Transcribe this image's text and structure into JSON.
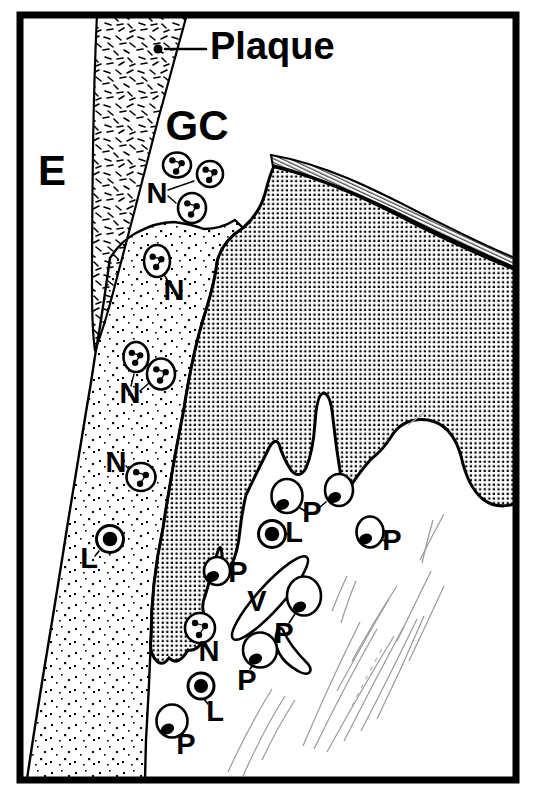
{
  "colors": {
    "ink": "#000000",
    "paper": "#ffffff",
    "fiber": "#999999"
  },
  "labels": {
    "enamel": "E",
    "crevice": "GC",
    "plaque": "Plaque"
  },
  "diagram": {
    "plaque_pointer_dot": {
      "x": 158,
      "y": 49,
      "r": 4.5
    },
    "leader_lines": [
      {
        "x1": 206,
        "y1": 49,
        "x2": 165,
        "y2": 49,
        "w": 2.5
      },
      {
        "x1": 168,
        "y1": 190,
        "x2": 194,
        "y2": 181,
        "w": 1.4
      },
      {
        "x1": 168,
        "y1": 196,
        "x2": 176,
        "y2": 203,
        "w": 1.4
      },
      {
        "x1": 165,
        "y1": 276,
        "x2": 171,
        "y2": 287,
        "w": 1.6
      },
      {
        "x1": 131,
        "y1": 386,
        "x2": 134,
        "y2": 374,
        "w": 1.4
      },
      {
        "x1": 140,
        "y1": 391,
        "x2": 149,
        "y2": 383,
        "w": 1.4
      },
      {
        "x1": 126,
        "y1": 466,
        "x2": 130,
        "y2": 470,
        "w": 1.6
      },
      {
        "x1": 203,
        "y1": 644,
        "x2": 207,
        "y2": 649,
        "w": 1.6
      },
      {
        "x1": 95,
        "y1": 556,
        "x2": 99,
        "y2": 551,
        "w": 1.6
      },
      {
        "x1": 287,
        "y1": 534,
        "x2": 290,
        "y2": 535,
        "w": 1.6
      },
      {
        "x1": 208,
        "y1": 704,
        "x2": 204,
        "y2": 699,
        "w": 1.6
      },
      {
        "x1": 305,
        "y1": 511,
        "x2": 300,
        "y2": 508,
        "w": 1.6
      },
      {
        "x1": 320,
        "y1": 507,
        "x2": 326,
        "y2": 502,
        "w": 1.6
      },
      {
        "x1": 385,
        "y1": 541,
        "x2": 381,
        "y2": 539,
        "w": 1.6
      },
      {
        "x1": 234,
        "y1": 572,
        "x2": 229,
        "y2": 571,
        "w": 1.6
      },
      {
        "x1": 289,
        "y1": 623,
        "x2": 295,
        "y2": 614,
        "w": 1.6
      },
      {
        "x1": 250,
        "y1": 669,
        "x2": 254,
        "y2": 663,
        "w": 1.6
      },
      {
        "x1": 182,
        "y1": 736,
        "x2": 179,
        "y2": 733,
        "w": 1.6
      }
    ],
    "cells": [
      {
        "type": "N",
        "x": 177,
        "y": 165,
        "rx": 14,
        "ry": 12.5
      },
      {
        "type": "N",
        "x": 210,
        "y": 174,
        "rx": 13,
        "ry": 13
      },
      {
        "type": "N",
        "x": 192,
        "y": 208,
        "rx": 14,
        "ry": 15
      },
      {
        "type": "N",
        "x": 157,
        "y": 261,
        "rx": 13,
        "ry": 16
      },
      {
        "type": "N",
        "x": 136,
        "y": 357,
        "rx": 12.5,
        "ry": 15
      },
      {
        "type": "N",
        "x": 161,
        "y": 374,
        "rx": 14,
        "ry": 15.5
      },
      {
        "type": "N",
        "x": 141,
        "y": 477,
        "rx": 14.5,
        "ry": 14
      },
      {
        "type": "N",
        "x": 200,
        "y": 628,
        "rx": 15,
        "ry": 15
      },
      {
        "type": "L",
        "x": 110,
        "y": 539,
        "rx": 13.5,
        "ry": 13.5
      },
      {
        "type": "L",
        "x": 272,
        "y": 534,
        "rx": 13.5,
        "ry": 13.5
      },
      {
        "type": "L",
        "x": 201,
        "y": 686,
        "rx": 13,
        "ry": 13
      },
      {
        "type": "P",
        "x": 287,
        "y": 496,
        "rx": 15.5,
        "ry": 17
      },
      {
        "type": "P",
        "x": 339,
        "y": 490,
        "rx": 14,
        "ry": 16
      },
      {
        "type": "P",
        "x": 370,
        "y": 532,
        "rx": 13.5,
        "ry": 15.5
      },
      {
        "type": "P",
        "x": 217,
        "y": 571,
        "rx": 13,
        "ry": 14
      },
      {
        "type": "P",
        "x": 304,
        "y": 596,
        "rx": 17,
        "ry": 19.5
      },
      {
        "type": "P",
        "x": 260,
        "y": 650,
        "rx": 17,
        "ry": 17.5
      },
      {
        "type": "P",
        "x": 172,
        "y": 721,
        "rx": 15.5,
        "ry": 16.5
      }
    ],
    "annotations": [
      {
        "text": "N",
        "x": 157,
        "y": 203
      },
      {
        "text": "N",
        "x": 174,
        "y": 300
      },
      {
        "text": "N",
        "x": 130,
        "y": 403
      },
      {
        "text": "N",
        "x": 116,
        "y": 472
      },
      {
        "text": "N",
        "x": 209,
        "y": 661
      },
      {
        "text": "L",
        "x": 89,
        "y": 568
      },
      {
        "text": "L",
        "x": 294,
        "y": 542
      },
      {
        "text": "L",
        "x": 215,
        "y": 721
      },
      {
        "text": "P",
        "x": 312,
        "y": 522
      },
      {
        "text": "P",
        "x": 238,
        "y": 582
      },
      {
        "text": "P",
        "x": 392,
        "y": 550
      },
      {
        "text": "P",
        "x": 284,
        "y": 643
      },
      {
        "text": "P",
        "x": 247,
        "y": 690
      },
      {
        "text": "P",
        "x": 186,
        "y": 754
      },
      {
        "text": "V",
        "x": 257,
        "y": 611
      }
    ]
  }
}
